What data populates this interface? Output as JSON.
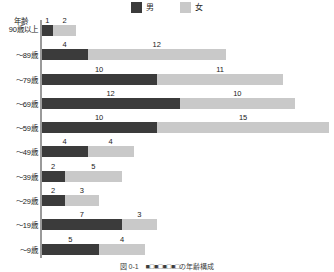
{
  "chart_data": {
    "type": "bar",
    "orientation": "horizontal",
    "stacked": true,
    "title": "",
    "xlabel": "",
    "ylabel": "年齢",
    "grid": false,
    "legend_position": "top-center",
    "axis_max": 25,
    "categories": [
      "90歳以上",
      "～89歳",
      "～79歳",
      "～69歳",
      "～59歳",
      "～49歳",
      "～39歳",
      "～29歳",
      "～19歳",
      "～9歳"
    ],
    "series": [
      {
        "name": "男",
        "color": "#3b3b3b",
        "values": [
          1,
          4,
          10,
          12,
          10,
          4,
          2,
          2,
          7,
          5
        ]
      },
      {
        "name": "女",
        "color": "#c9c9c9",
        "values": [
          2,
          12,
          11,
          10,
          15,
          4,
          5,
          3,
          3,
          4
        ]
      }
    ],
    "totals": [
      3,
      16,
      21,
      22,
      25,
      8,
      7,
      5,
      10,
      9
    ]
  },
  "legend": {
    "entries": [
      {
        "label": "男",
        "color": "#3b3b3b"
      },
      {
        "label": "女",
        "color": "#c9c9c9"
      }
    ]
  },
  "axis": {
    "title": "年齢"
  },
  "rows": [
    {
      "label": "90歳以上",
      "male": "1",
      "female": "2"
    },
    {
      "label": "～89歳",
      "male": "4",
      "female": "12"
    },
    {
      "label": "～79歳",
      "male": "10",
      "female": "11"
    },
    {
      "label": "～69歳",
      "male": "12",
      "female": "10"
    },
    {
      "label": "～59歳",
      "male": "10",
      "female": "15"
    },
    {
      "label": "～49歳",
      "male": "4",
      "female": "4"
    },
    {
      "label": "～39歳",
      "male": "2",
      "female": "5"
    },
    {
      "label": "～29歳",
      "male": "2",
      "female": "3"
    },
    {
      "label": "～19歳",
      "male": "7",
      "female": "3"
    },
    {
      "label": "～9歳",
      "male": "5",
      "female": "4"
    }
  ],
  "caption": "図 0-1　■□■□■□■□の年齢構成"
}
